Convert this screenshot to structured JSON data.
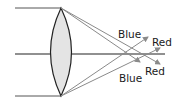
{
  "diagram": {
    "type": "chromatic-aberration-lens",
    "labels": {
      "blue_top": "Blue",
      "red_top": "Red",
      "blue_bottom": "Blue",
      "red_bottom": "Red"
    },
    "colors": {
      "line": "#222222",
      "ray": "#8a8a8a",
      "lens_fill": "#e4e4e4",
      "background": "#ffffff"
    }
  }
}
